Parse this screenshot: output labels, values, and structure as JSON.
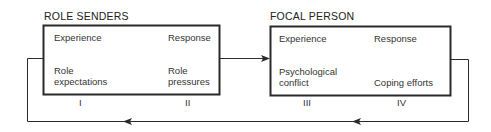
{
  "diagram": {
    "type": "role-episode-flow",
    "stroke_color": "#2a2a2a",
    "boxes": [
      {
        "id": "role-senders",
        "title": "ROLE SENDERS",
        "top_left": "Experience",
        "top_right": "Response",
        "bottom_left": [
          "Role",
          "expectations"
        ],
        "bottom_right": [
          "Role",
          "pressures"
        ],
        "numerals": [
          "I",
          "II"
        ]
      },
      {
        "id": "focal-person",
        "title": "FOCAL PERSON",
        "top_left": "Experience",
        "top_right": "Response",
        "bottom_left": [
          "Psychological",
          "conflict"
        ],
        "bottom_right": [
          "Coping efforts"
        ],
        "numerals": [
          "III",
          "IV"
        ]
      }
    ],
    "connections": [
      {
        "from": "role-senders",
        "to": "focal-person",
        "direction": "right"
      },
      {
        "from": "focal-person",
        "to": "role-senders",
        "direction": "feedback-loop-left"
      }
    ]
  }
}
